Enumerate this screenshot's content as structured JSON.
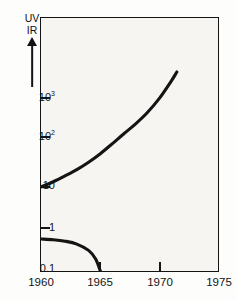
{
  "figure": {
    "title": "",
    "background_color": "#fdfdfc",
    "plot_background_color": "#f6f5f2",
    "line_color": "#141414",
    "axis_color": "#141414"
  },
  "ratio_marker": {
    "numerator": "UV",
    "denominator": "IR",
    "arrow": "up-arrow",
    "meaning": "increasing UV to IR ratio"
  },
  "y_axis": {
    "scale": "log",
    "tick_labels": [
      "10³",
      "10²",
      "10",
      "1",
      "0.1"
    ],
    "tick_values": [
      1000,
      100,
      10,
      1,
      0.1
    ],
    "label_10_3": "10",
    "label_10_3_exp": "3",
    "label_10_2": "10",
    "label_10_2_exp": "2",
    "label_10": "10",
    "label_1": "1",
    "label_0_1": "0.1"
  },
  "x_axis": {
    "scale": "linear",
    "tick_labels": [
      "1960",
      "1965",
      "1970",
      "1975"
    ],
    "tick_values": [
      1960,
      1965,
      1970,
      1975
    ],
    "label_1960": "1960",
    "label_1965": "1965",
    "label_1970": "1970",
    "label_1975": "1975"
  },
  "chart_data": {
    "type": "line",
    "title": "",
    "xlabel": "",
    "ylabel": "UV / IR",
    "xlim": [
      1960,
      1975
    ],
    "ylim": [
      0.1,
      10000
    ],
    "yscale": "log",
    "xscale": "linear",
    "grid": false,
    "legend": "none",
    "xticks": [
      1960,
      1965,
      1970,
      1975
    ],
    "yticks": [
      0.1,
      1,
      10,
      100,
      1000
    ],
    "ytick_labels": [
      "0.1",
      "1",
      "10",
      "10²",
      "10³"
    ],
    "series": [
      {
        "name": "upper-curve",
        "description": "rising curve from 10 at 1960 exiting top of frame near 1971.5",
        "x": [
          1960.0,
          1961.0,
          1962.0,
          1963.0,
          1964.0,
          1965.0,
          1966.0,
          1967.0,
          1968.0,
          1969.0,
          1970.0,
          1971.0,
          1971.5
        ],
        "y": [
          10,
          12.6,
          16.5,
          22,
          31,
          46,
          72,
          120,
          215,
          420,
          950,
          2600,
          4600
        ]
      },
      {
        "name": "lower-curve",
        "description": "falling curve from about 0.55 at 1960 reaching 0.1 at 1965",
        "x": [
          1960.0,
          1961.0,
          1962.0,
          1963.0,
          1964.0,
          1964.6,
          1965.0
        ],
        "y": [
          0.55,
          0.53,
          0.49,
          0.42,
          0.3,
          0.19,
          0.1
        ]
      }
    ]
  }
}
